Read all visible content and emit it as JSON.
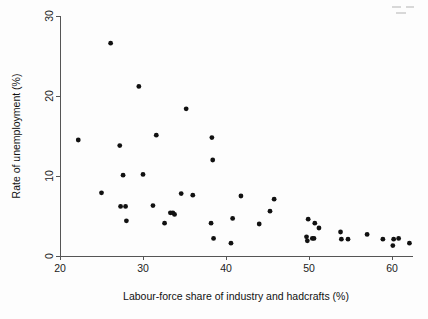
{
  "figure": {
    "background_color": "#fdfdfd",
    "point_color": "#111111",
    "axis_color": "#555555",
    "point_radius": 2.4
  },
  "chart_data": {
    "type": "scatter",
    "title": "",
    "subtitle": "",
    "xlabel": "Labour-force share of industry and hadcrafts (%)",
    "ylabel": "Rate of unemployment (%)",
    "xlim": [
      20,
      62.5
    ],
    "ylim": [
      0,
      30
    ],
    "xticks": [
      20,
      30,
      40,
      50,
      60
    ],
    "yticks": [
      0,
      10,
      20,
      30
    ],
    "xtick_labels": [
      "20",
      "30",
      "40",
      "50",
      "60"
    ],
    "ytick_labels": [
      "0",
      "10",
      "20",
      "30"
    ],
    "grid": false,
    "legend": null,
    "legend_position": "none",
    "marker": "filled-circle",
    "series": [
      {
        "name": "regions",
        "points": [
          [
            22.2,
            14.5
          ],
          [
            25.0,
            7.9
          ],
          [
            26.1,
            26.6
          ],
          [
            27.2,
            13.8
          ],
          [
            27.3,
            6.2
          ],
          [
            27.6,
            10.1
          ],
          [
            27.9,
            6.2
          ],
          [
            28.0,
            4.4
          ],
          [
            29.5,
            21.2
          ],
          [
            30.0,
            10.2
          ],
          [
            31.2,
            6.3
          ],
          [
            31.6,
            15.1
          ],
          [
            32.6,
            4.1
          ],
          [
            33.3,
            5.4
          ],
          [
            33.6,
            5.4
          ],
          [
            33.8,
            5.2
          ],
          [
            34.6,
            7.8
          ],
          [
            35.2,
            18.4
          ],
          [
            36.0,
            7.6
          ],
          [
            38.2,
            4.1
          ],
          [
            38.3,
            14.8
          ],
          [
            38.4,
            12.0
          ],
          [
            38.5,
            2.2
          ],
          [
            40.6,
            1.6
          ],
          [
            40.8,
            4.7
          ],
          [
            41.8,
            7.5
          ],
          [
            44.0,
            4.0
          ],
          [
            45.3,
            5.6
          ],
          [
            45.8,
            7.1
          ],
          [
            49.7,
            2.4
          ],
          [
            49.8,
            1.9
          ],
          [
            49.9,
            4.6
          ],
          [
            50.4,
            2.2
          ],
          [
            50.6,
            2.2
          ],
          [
            50.7,
            4.1
          ],
          [
            51.2,
            3.5
          ],
          [
            53.8,
            3.0
          ],
          [
            53.9,
            2.1
          ],
          [
            54.7,
            2.1
          ],
          [
            57.0,
            2.7
          ],
          [
            58.9,
            2.1
          ],
          [
            60.1,
            1.3
          ],
          [
            60.2,
            2.1
          ],
          [
            60.8,
            2.2
          ],
          [
            62.1,
            1.6
          ]
        ]
      }
    ]
  }
}
